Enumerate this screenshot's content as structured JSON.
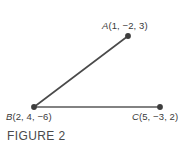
{
  "figure": {
    "caption": "FIGURE 2",
    "background_color": "#ffffff",
    "stroke_color": "#4a4a4a",
    "vertex_color": "#3d3d3d",
    "text_color": "#3a3a3a"
  },
  "points": {
    "A": {
      "letter": "A",
      "coords_text": "(1, −2, 3)",
      "label_full": "A(1, −2, 3)",
      "x": 1,
      "y": -2,
      "z": 3,
      "pixel_x": 128,
      "pixel_y": 36
    },
    "B": {
      "letter": "B",
      "coords_text": "(2, 4, −6)",
      "label_full": "B(2, 4, −6)",
      "x": 2,
      "y": 4,
      "z": -6,
      "pixel_x": 34,
      "pixel_y": 107
    },
    "C": {
      "letter": "C",
      "coords_text": "(5, −3, 2)",
      "label_full": "C(5, −3, 2)",
      "x": 5,
      "y": -3,
      "z": 2,
      "pixel_x": 160,
      "pixel_y": 107
    }
  },
  "segments": [
    {
      "name": "segment-BA",
      "from": "B",
      "to": "A",
      "x1": 34,
      "y1": 107,
      "x2": 128,
      "y2": 36
    },
    {
      "name": "segment-BC",
      "from": "B",
      "to": "C",
      "x1": 34,
      "y1": 107,
      "x2": 160,
      "y2": 107
    }
  ]
}
